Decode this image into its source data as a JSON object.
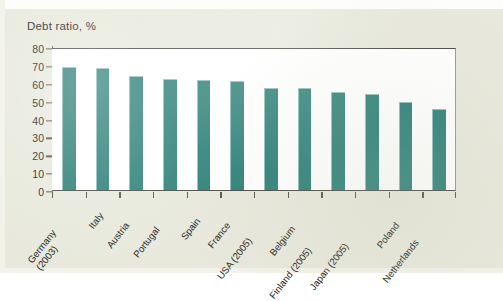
{
  "chart_data": {
    "type": "bar",
    "title": "Debt ratio, %",
    "xlabel": "",
    "ylabel": "",
    "ylim": [
      0,
      80
    ],
    "yticks": [
      0,
      10,
      20,
      30,
      40,
      50,
      60,
      70,
      80
    ],
    "grid": false,
    "legend": null,
    "bar_color": "#2f8179",
    "categories": [
      "Germany\n(2003)",
      "Italy",
      "Austria",
      "Portugal",
      "Spain",
      "France",
      "USA (2005)",
      "Belgium",
      "Finland (2005)",
      "Japan (2005)",
      "Poland",
      "Netherlands"
    ],
    "values": [
      69,
      68.5,
      64,
      62,
      61.5,
      61,
      57,
      57,
      55,
      53.5,
      49,
      45.5
    ]
  },
  "colors": {
    "bar": "#2f8179",
    "page_background": "#e8e9dc",
    "plot_background": "#ffffff",
    "axis": "#4c4c46",
    "text": "#23231e"
  }
}
